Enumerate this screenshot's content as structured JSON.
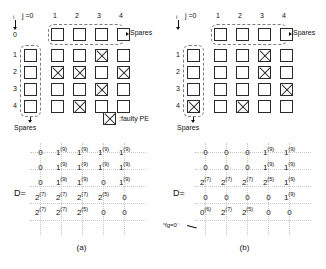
{
  "figure": {
    "legend_label": ":faulty PE",
    "spares_label": "Spares",
    "j_axis_label": "j =0",
    "i_axis_label": "i",
    "matrix_label": "D=",
    "sfg_annotation": "ˢfg=0⁻"
  },
  "panels": [
    {
      "id": "a",
      "caption": "(a)",
      "col_headers": [
        "1",
        "2",
        "3",
        "4"
      ],
      "row_headers": [
        "0",
        "1",
        "2",
        "3",
        "4"
      ],
      "spare_row_label": "Spares",
      "spare_col_label": "Spares",
      "grid": {
        "rows": 5,
        "cols": 5,
        "faulty_cells": [
          {
            "row": 1,
            "col": 3
          },
          {
            "row": 2,
            "col": 1
          },
          {
            "row": 2,
            "col": 2
          },
          {
            "row": 2,
            "col": 4
          },
          {
            "row": 3,
            "col": 3
          },
          {
            "row": 4,
            "col": 2
          }
        ]
      },
      "matrix": {
        "rows": [
          [
            {
              "v": "0",
              "s": ""
            },
            {
              "v": "1",
              "s": "(9)"
            },
            {
              "v": "1",
              "s": "(9)"
            },
            {
              "v": "1",
              "s": "(9)"
            },
            {
              "v": "1",
              "s": "(9)"
            }
          ],
          [
            {
              "v": "0",
              "s": ""
            },
            {
              "v": "1",
              "s": "(9)"
            },
            {
              "v": "1",
              "s": "(9)"
            },
            {
              "v": "1",
              "s": "(9)"
            },
            {
              "v": "1",
              "s": "(9)"
            }
          ],
          [
            {
              "v": "0",
              "s": ""
            },
            {
              "v": "1",
              "s": "(9)"
            },
            {
              "v": "1",
              "s": "(9)"
            },
            {
              "v": "0",
              "s": ""
            },
            {
              "v": "1",
              "s": "(9)"
            }
          ],
          [
            {
              "v": "2",
              "s": "(7)"
            },
            {
              "v": "2",
              "s": "(7)"
            },
            {
              "v": "2",
              "s": "(7)"
            },
            {
              "v": "2",
              "s": "(5)"
            },
            {
              "v": "0",
              "s": ""
            }
          ],
          [
            {
              "v": "2",
              "s": "(7)"
            },
            {
              "v": "2",
              "s": "(7)"
            },
            {
              "v": "2",
              "s": "(5)"
            },
            {
              "v": "0",
              "s": ""
            },
            {
              "v": "0",
              "s": ""
            }
          ]
        ]
      }
    },
    {
      "id": "b",
      "caption": "(b)",
      "col_headers": [
        "1",
        "2",
        "3",
        "4"
      ],
      "row_headers": [
        "0",
        "1",
        "2",
        "3",
        "4"
      ],
      "spare_row_label": "Spares",
      "spare_col_label": "Spares",
      "grid": {
        "rows": 5,
        "cols": 5,
        "faulty_cells": [
          {
            "row": 1,
            "col": 3
          },
          {
            "row": 2,
            "col": 3
          },
          {
            "row": 3,
            "col": 4
          },
          {
            "row": 4,
            "col": 0
          },
          {
            "row": 4,
            "col": 2
          }
        ]
      },
      "matrix": {
        "rows": [
          [
            {
              "v": "0",
              "s": ""
            },
            {
              "v": "0",
              "s": ""
            },
            {
              "v": "0",
              "s": ""
            },
            {
              "v": "1",
              "s": "(9)"
            },
            {
              "v": "1",
              "s": "(9)"
            }
          ],
          [
            {
              "v": "0",
              "s": ""
            },
            {
              "v": "0",
              "s": ""
            },
            {
              "v": "0",
              "s": ""
            },
            {
              "v": "1",
              "s": "(9)"
            },
            {
              "v": "1",
              "s": "(9)"
            }
          ],
          [
            {
              "v": "2",
              "s": "(7)"
            },
            {
              "v": "2",
              "s": "(7)"
            },
            {
              "v": "2",
              "s": "(7)"
            },
            {
              "v": "2",
              "s": "(5)"
            },
            {
              "v": "1",
              "s": "(9)"
            }
          ],
          [
            {
              "v": "0",
              "s": ""
            },
            {
              "v": "0",
              "s": ""
            },
            {
              "v": "0",
              "s": ""
            },
            {
              "v": "0",
              "s": ""
            },
            {
              "v": "1",
              "s": "(9)"
            }
          ],
          [
            {
              "v": "0",
              "s": "(6)"
            },
            {
              "v": "2",
              "s": "(7)"
            },
            {
              "v": "2",
              "s": "(5)"
            },
            {
              "v": "0",
              "s": ""
            },
            {
              "v": "0",
              "s": ""
            }
          ]
        ]
      }
    }
  ],
  "colors": {
    "cell_border": "#2a2a2a",
    "dashed_border": "#7d7d7d",
    "dotted_guide": "#c9c9c9",
    "text": "#111111",
    "background": "#ffffff"
  }
}
